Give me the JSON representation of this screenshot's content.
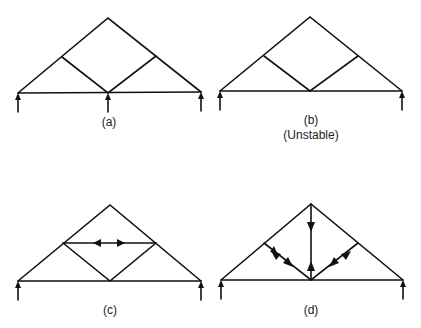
{
  "figure": {
    "panels": [
      {
        "id": "a",
        "label": "(a)",
        "note": "",
        "supports": 3,
        "description": "Truss with two diagonal web members meeting at bottom center support"
      },
      {
        "id": "b",
        "label": "(b)",
        "note": "(Unstable)",
        "supports": 2,
        "description": "Truss with two diagonal web members, end supports only"
      },
      {
        "id": "c",
        "label": "(c)",
        "note": "",
        "supports": 2,
        "description": "Truss with added horizontal member showing tension arrows"
      },
      {
        "id": "d",
        "label": "(d)",
        "note": "",
        "supports": 2,
        "description": "Truss with added vertical member; arrows on web members"
      }
    ],
    "colors": {
      "line": "#111111",
      "background": "#ffffff",
      "text": "#222222"
    }
  }
}
